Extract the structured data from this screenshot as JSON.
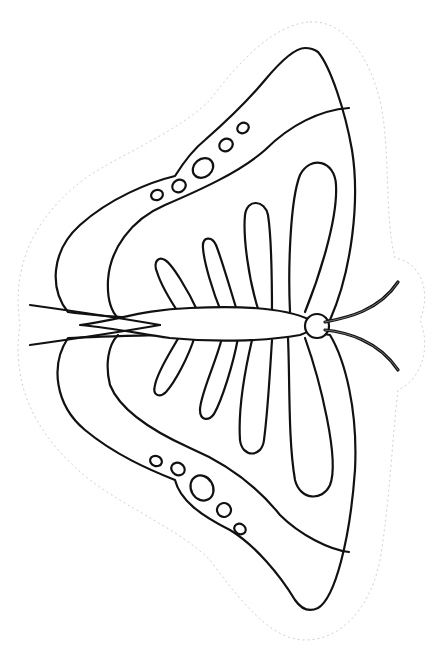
{
  "image": {
    "subject": "butterfly coloring page",
    "style": "black line art on white",
    "colors": {
      "background": "#ffffff",
      "outline": "#111111",
      "cut_line": "#d0d0d0"
    },
    "parts": {
      "upper_wing": {
        "spots": 5,
        "stripes": 4
      },
      "lower_wing": {
        "spots": 5,
        "stripes": 4
      },
      "body": "elongated oval with round head",
      "antennae": 2,
      "cut_outline": "dotted"
    }
  }
}
